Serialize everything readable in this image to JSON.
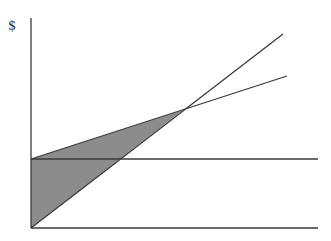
{
  "chart_data": {
    "type": "line",
    "title": "",
    "ylabel": "$",
    "xlabel": "",
    "grid": false,
    "legend": null,
    "series": [
      {
        "name": "fixed-cost-line",
        "points": [
          [
            31,
            159
          ],
          [
            318,
            159
          ]
        ]
      },
      {
        "name": "total-cost-line",
        "points": [
          [
            31,
            159
          ],
          [
            287,
            76
          ]
        ]
      },
      {
        "name": "revenue-line",
        "points": [
          [
            31,
            228
          ],
          [
            283,
            34
          ]
        ]
      }
    ],
    "shaded_regions": [
      {
        "name": "loss-area",
        "polygon": [
          [
            31,
            159
          ],
          [
            31,
            228
          ],
          [
            183,
            110
          ]
        ],
        "color": "#8c8c8c"
      }
    ],
    "axes": {
      "origin": [
        31,
        228
      ],
      "y_top": 18,
      "x_right": 318
    }
  },
  "labels": {
    "y_axis": "$"
  },
  "colors": {
    "line": "#3a3a3a",
    "fill": "#8c8c8c",
    "background": "#ffffff"
  }
}
